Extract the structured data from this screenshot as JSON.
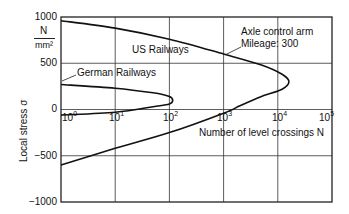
{
  "chart_data": {
    "type": "line",
    "title": "",
    "xlabel": "Number of level crossings N",
    "ylabel": "Local stress σ",
    "yunit": {
      "numerator": "N",
      "denominator": "mm²"
    },
    "xscale": "log",
    "xlim": [
      1,
      100000
    ],
    "ylim": [
      -1000,
      1000
    ],
    "grid": true,
    "x_ticks": [
      {
        "base": "10",
        "exp": "0"
      },
      {
        "base": "10",
        "exp": "1"
      },
      {
        "base": "10",
        "exp": "2"
      },
      {
        "base": "10",
        "exp": "3"
      },
      {
        "base": "10",
        "exp": "4"
      },
      {
        "base": "10",
        "exp": "5"
      }
    ],
    "y_ticks": [
      "1000",
      "500",
      "0",
      "−500",
      "−1000"
    ],
    "annotation": {
      "line1": "Axle control arm",
      "line2": "Mileage: 300"
    },
    "series": [
      {
        "name": "US Railways",
        "points": [
          {
            "N": 1,
            "sigma": 960
          },
          {
            "N": 10,
            "sigma": 880
          },
          {
            "N": 100,
            "sigma": 760
          },
          {
            "N": 1000,
            "sigma": 600
          },
          {
            "N": 5000,
            "sigma": 480
          },
          {
            "N": 12000,
            "sigma": 380
          },
          {
            "N": 16000,
            "sigma": 300
          },
          {
            "N": 12000,
            "sigma": 220
          },
          {
            "N": 5000,
            "sigma": 140
          },
          {
            "N": 2000,
            "sigma": 40
          },
          {
            "N": 1000,
            "sigma": -40
          },
          {
            "N": 100,
            "sigma": -250
          },
          {
            "N": 10,
            "sigma": -420
          },
          {
            "N": 1,
            "sigma": -600
          }
        ]
      },
      {
        "name": "German Railways",
        "points": [
          {
            "N": 1,
            "sigma": 270
          },
          {
            "N": 10,
            "sigma": 230
          },
          {
            "N": 50,
            "sigma": 180
          },
          {
            "N": 100,
            "sigma": 140
          },
          {
            "N": 115,
            "sigma": 100
          },
          {
            "N": 100,
            "sigma": 60
          },
          {
            "N": 50,
            "sigma": 30
          },
          {
            "N": 10,
            "sigma": -30
          },
          {
            "N": 1,
            "sigma": -60
          }
        ]
      }
    ],
    "legend": {
      "position": "inline-labels"
    }
  }
}
